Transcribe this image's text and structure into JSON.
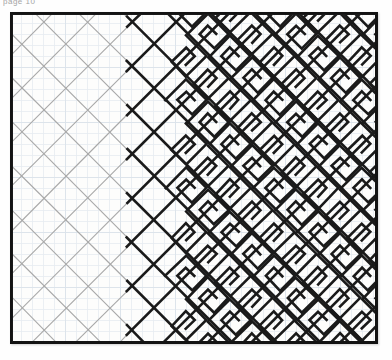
{
  "page_label": "page 10",
  "plate": {
    "title": "progressive lattice to meander study",
    "frame": {
      "color": "#131313",
      "width_px": 3
    },
    "background": "#fdfdfc",
    "graph_paper": {
      "cell_px": 11,
      "color": "#c9d6e4",
      "opacity": 0.42
    },
    "ink": {
      "dark": "#1a1a1a",
      "mid": "#5d5d5d",
      "light": "#a8a8a8"
    },
    "zones": [
      {
        "name": "light-lattice",
        "label": "plain diagonal lattice",
        "x_start": 0,
        "x_end": 118,
        "stroke": "#a8a8a8",
        "stroke_width": 1.1,
        "description": "faint pencil diamond grid only"
      },
      {
        "name": "bold-lattice",
        "label": "heavy diamond lattice",
        "x_start": 118,
        "x_end": 172,
        "stroke": "#1a1a1a",
        "stroke_width": 2.6,
        "description": "same lattice inked in heavy black"
      },
      {
        "name": "meander",
        "label": "diagonal greek key meander",
        "x_start": 172,
        "x_end": 368,
        "stroke": "#1a1a1a",
        "stroke_width": 2.6,
        "description": "spiral fret worked into each lattice cell"
      }
    ],
    "lattice": {
      "pitch_px": 44,
      "angle_deg": 45
    },
    "meander": {
      "turns": 2,
      "step_px": 5.5
    }
  }
}
